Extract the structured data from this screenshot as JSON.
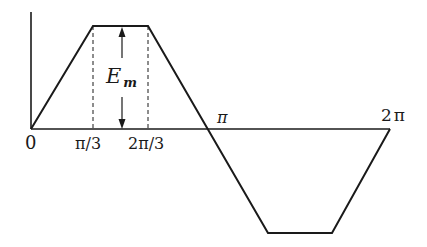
{
  "diagram": {
    "type": "trapezoidal-waveform",
    "colors": {
      "line": "#1a1a1a",
      "background": "#ffffff"
    },
    "labels": {
      "origin": "0",
      "pi_over_3": "π/3",
      "two_pi_over_3": "2π/3",
      "pi": "π",
      "two_pi": "2π",
      "amplitude_main": "E",
      "amplitude_sub": "m"
    },
    "waveform_points": [
      {
        "phase": "0",
        "value": 0
      },
      {
        "phase": "π/3",
        "value": 1
      },
      {
        "phase": "2π/3",
        "value": 1
      },
      {
        "phase": "π",
        "value": 0
      },
      {
        "phase": "4π/3",
        "value": -1
      },
      {
        "phase": "5π/3",
        "value": -1
      },
      {
        "phase": "2π",
        "value": 0
      }
    ],
    "annotations": [
      {
        "kind": "dashed-guide",
        "at": "π/3"
      },
      {
        "kind": "dashed-guide",
        "at": "2π/3"
      },
      {
        "kind": "double-arrow",
        "label": "E_m",
        "from": 0,
        "to": 1
      }
    ]
  }
}
